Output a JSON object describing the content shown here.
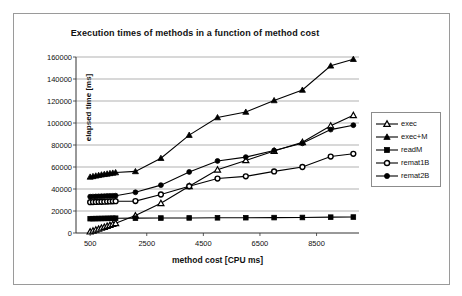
{
  "chart_data": {
    "type": "line",
    "title": "Execution times of methods in a function of method cost",
    "xlabel": "method cost [CPU ms]",
    "ylabel": "elapsed time [ms]",
    "xlim": [
      0,
      10000
    ],
    "ylim": [
      0,
      160000
    ],
    "grid": true,
    "grid_axis": "y",
    "legend_position": "right",
    "x_ticks": [
      500,
      2500,
      4500,
      6500,
      8500
    ],
    "y_ticks": [
      0,
      20000,
      40000,
      60000,
      80000,
      100000,
      120000,
      140000,
      160000
    ],
    "series": [
      {
        "name": "exec",
        "marker": "triangle-open",
        "color": "#000000",
        "x": [
          500,
          600,
          700,
          800,
          900,
          1000,
          1100,
          1200,
          1300,
          1400,
          2100,
          3000,
          4000,
          5000,
          6000,
          7000,
          8000,
          9000,
          9800
        ],
        "y": [
          1200,
          2000,
          2900,
          3700,
          4600,
          5400,
          6300,
          7100,
          8000,
          8800,
          15800,
          27000,
          42500,
          57500,
          66000,
          74500,
          82500,
          97500,
          107000
        ]
      },
      {
        "name": "exec+M",
        "marker": "triangle-filled",
        "color": "#000000",
        "x": [
          500,
          600,
          700,
          800,
          900,
          1000,
          1100,
          1200,
          1300,
          1400,
          2100,
          3000,
          4000,
          5000,
          6000,
          7000,
          8000,
          9000,
          9800
        ],
        "y": [
          51000,
          51500,
          52000,
          52500,
          53000,
          53400,
          53800,
          54200,
          54600,
          55000,
          56000,
          68000,
          89000,
          105000,
          110000,
          120500,
          130000,
          152000,
          158000
        ]
      },
      {
        "name": "readM",
        "marker": "square-filled",
        "color": "#000000",
        "x": [
          500,
          600,
          700,
          800,
          900,
          1000,
          1100,
          1200,
          1300,
          1400,
          2100,
          3000,
          4000,
          5000,
          6000,
          7000,
          8000,
          9000,
          9800
        ],
        "y": [
          13000,
          13050,
          13100,
          13150,
          13200,
          13250,
          13300,
          13350,
          13400,
          13450,
          13500,
          13600,
          13700,
          13800,
          13900,
          14000,
          14100,
          14400,
          14500
        ]
      },
      {
        "name": "remat1B",
        "marker": "circle-open",
        "color": "#000000",
        "x": [
          500,
          600,
          700,
          800,
          900,
          1000,
          1100,
          1200,
          1300,
          1400,
          2100,
          3000,
          4000,
          5000,
          6000,
          7000,
          8000,
          9000,
          9800
        ],
        "y": [
          28000,
          28100,
          28200,
          28300,
          28400,
          28500,
          28600,
          28700,
          28800,
          28900,
          29000,
          35000,
          42500,
          49500,
          51500,
          56000,
          60000,
          69500,
          72000
        ]
      },
      {
        "name": "remat2B",
        "marker": "circle-filled",
        "color": "#000000",
        "x": [
          500,
          600,
          700,
          800,
          900,
          1000,
          1100,
          1200,
          1300,
          1400,
          2100,
          3000,
          4000,
          5000,
          6000,
          7000,
          8000,
          9000,
          9800
        ],
        "y": [
          33000,
          33100,
          33200,
          33300,
          33400,
          33500,
          33600,
          33700,
          33800,
          33900,
          37000,
          43500,
          55500,
          65500,
          69000,
          75000,
          81500,
          94000,
          98000
        ]
      }
    ]
  },
  "legend": {
    "items": [
      {
        "label": "exec",
        "marker": "triangle-open"
      },
      {
        "label": "exec+M",
        "marker": "triangle-filled"
      },
      {
        "label": "readM",
        "marker": "square-filled"
      },
      {
        "label": "remat1B",
        "marker": "circle-open"
      },
      {
        "label": "remat2B",
        "marker": "circle-filled"
      }
    ]
  }
}
